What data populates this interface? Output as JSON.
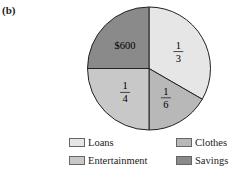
{
  "panel_label": "(b)",
  "chart_data": {
    "type": "pie",
    "title": "",
    "start_angle_deg": 0,
    "direction": "clockwise",
    "slices": [
      {
        "label": "Loans",
        "fraction": 0.3333,
        "display": "1/3",
        "numerator": "1",
        "denominator": "3",
        "color": "#e6e6e6"
      },
      {
        "label": "Clothes",
        "fraction": 0.1667,
        "display": "1/6",
        "numerator": "1",
        "denominator": "6",
        "color": "#b8b8b8"
      },
      {
        "label": "Entertainment",
        "fraction": 0.25,
        "display": "1/4",
        "numerator": "1",
        "denominator": "4",
        "color": "#c8c8c8"
      },
      {
        "label": "Savings",
        "fraction": 0.25,
        "display": "$600",
        "color": "#8a8a8a"
      }
    ],
    "legend": [
      "Loans",
      "Clothes",
      "Entertainment",
      "Savings"
    ],
    "legend_position": "bottom",
    "note": "Slice-to-legend mapping inferred from fraction labels, not confirmed from swatch colors (the greys were indistinguishable at this resolution). Only Savings is labelled $600 in the chart."
  },
  "legend": {
    "items": [
      {
        "label": "Loans",
        "color": "#e6e6e6"
      },
      {
        "label": "Clothes",
        "color": "#b8b8b8"
      },
      {
        "label": "Entertainment",
        "color": "#c8c8c8"
      },
      {
        "label": "Savings",
        "color": "#8a8a8a"
      }
    ]
  }
}
